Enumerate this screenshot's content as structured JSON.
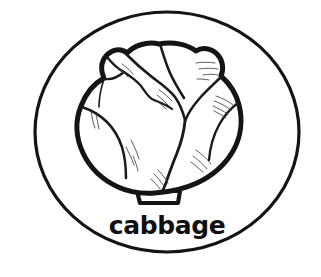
{
  "card": {
    "title": "cabbage",
    "background_color": "#ffffff",
    "ink_color": "#141414"
  },
  "border": {
    "shape_name": "oval-border",
    "center_x": 167,
    "center_y": 132,
    "radius_x": 132,
    "radius_y": 120,
    "stroke_width": 3.2,
    "color": "#141414"
  },
  "illustration": {
    "subject": "cabbage",
    "style": "black-and-white line drawing",
    "body_stroke_width": 5.0,
    "crease_stroke_width": 2.4,
    "stem": {
      "name": "cabbage-stem",
      "x": 136,
      "y": 190,
      "width": 45,
      "height": 14
    }
  },
  "caption": {
    "label": "cabbage",
    "x": 167,
    "y": 234,
    "font_size_px": 25,
    "color": "#101010"
  }
}
